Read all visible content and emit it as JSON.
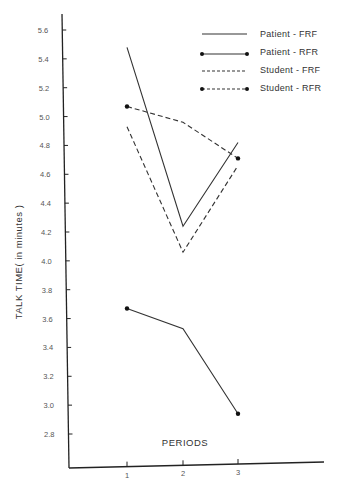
{
  "chart_data": {
    "type": "line",
    "title": "",
    "xlabel": "PERIODS",
    "ylabel": "TALK TIME( in minutes )",
    "x": [
      1,
      2,
      3
    ],
    "x_tick_labels": [
      "1",
      "2",
      "3"
    ],
    "y_tick_labels": [
      "5.6",
      "5.4",
      "5.2",
      "5.0",
      "4.8",
      "4.6",
      "4.4",
      "4.2",
      "4.0",
      "3.8",
      "3.6",
      "3.4",
      "3.2",
      "3.0",
      "2.8"
    ],
    "ylim": [
      2.6,
      5.7
    ],
    "grid": false,
    "legend_position": "top-right",
    "series": [
      {
        "name": "Patient - FRF",
        "style": "solid",
        "markers": false,
        "values": [
          5.48,
          4.24,
          4.82
        ]
      },
      {
        "name": "Patient - RFR",
        "style": "solid",
        "markers": true,
        "values": [
          3.67,
          3.53,
          2.94
        ]
      },
      {
        "name": "Student - FRF",
        "style": "dashed",
        "markers": false,
        "values": [
          4.93,
          4.06,
          4.66
        ]
      },
      {
        "name": "Student - RFR",
        "style": "dashed",
        "markers": true,
        "values": [
          5.07,
          4.96,
          4.71
        ]
      }
    ]
  },
  "colors": {
    "line": "#333333",
    "text": "#444444",
    "background": "#ffffff"
  }
}
